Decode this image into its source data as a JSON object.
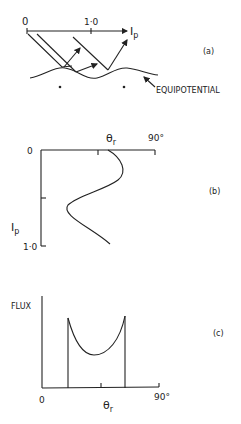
{
  "panel_a": {
    "label": "(a)",
    "axis_origin": "0",
    "axis_tick": "1·0",
    "axis_var": "I",
    "axis_var_sub": "p",
    "surface_label": "EQUIPOTENTIAL"
  },
  "panel_b": {
    "label": "(b)",
    "origin": "0",
    "x_label": "θ",
    "x_label_sub": "r",
    "x_max": "90°",
    "y_label": "I",
    "y_label_sub": "p",
    "y_max": "1·0"
  },
  "panel_c": {
    "label": "(c)",
    "y_label": "FLUX",
    "origin": "0",
    "x_max": "90°",
    "x_label": "θ",
    "x_label_sub": "r"
  }
}
